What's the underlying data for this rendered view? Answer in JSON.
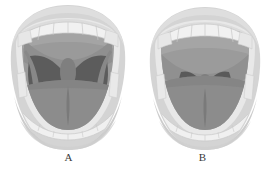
{
  "illustration": {
    "title": "Open mouth oropharyngeal views",
    "background_color": "#ffffff",
    "figures": [
      {
        "id": "A",
        "caption": "A",
        "description": "Open mouth with soft palate, fauces, uvula and tonsillar pillars fully visible",
        "visible_structures": [
          "upper lip",
          "upper teeth",
          "hard palate",
          "soft palate",
          "anterior tonsillar pillar",
          "posterior tonsillar pillar",
          "uvula",
          "oropharynx",
          "tongue",
          "lower teeth",
          "lower lip"
        ],
        "pharynx_visibility": "full"
      },
      {
        "id": "B",
        "caption": "B",
        "description": "Open mouth with tongue obscuring the fauces; only soft palate and base of uvula visible",
        "visible_structures": [
          "upper lip",
          "upper teeth",
          "hard palate",
          "soft palate",
          "base of uvula",
          "tongue",
          "lower teeth",
          "lower lip"
        ],
        "pharynx_visibility": "partial"
      }
    ],
    "colors": {
      "background": "#ffffff",
      "outer_lip": "#d5d5d5",
      "lip_shadow": "#c2c2c2",
      "inner_lip_rim": "#ededed",
      "tooth": "#f2f2f2",
      "tooth_outline": "#c9c9c9",
      "gum": "#dcdcdc",
      "palate_mucosa": "#9a9a9a",
      "soft_palate": "#8e8e8e",
      "pillar": "#868686",
      "pharynx_dark": "#5d5d5d",
      "pharynx_deep": "#575757",
      "uvula": "#7e7e7e",
      "tongue": "#8b8b8b",
      "tongue_groove": "#7d7d7d",
      "caption_text": "#3a3a3a"
    }
  }
}
